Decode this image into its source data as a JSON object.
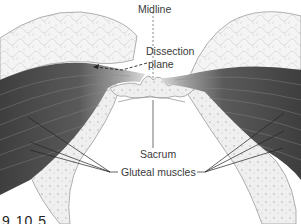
{
  "figure": {
    "labels": {
      "midline": "Midline",
      "dissection_plane_line1": "Dissection",
      "dissection_plane_line2": "plane",
      "sacrum": "Sacrum",
      "gluteal_muscles": "Gluteal muscles"
    },
    "caption": "9.10.5",
    "colors": {
      "fat": "#f2f2f2",
      "fat_lines": "#c8c8c8",
      "muscle_dark": "#4a4a4a",
      "muscle_light": "#9a9a9a",
      "bone": "#ececec",
      "bone_outline": "#9c9c9c",
      "leader": "#222222"
    }
  }
}
